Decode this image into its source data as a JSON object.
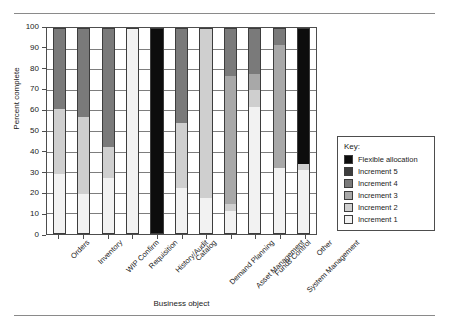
{
  "chart_data": {
    "type": "bar",
    "subtype": "stacked-bar-100",
    "title": "",
    "xlabel": "Business object",
    "ylabel": "Percent complete",
    "ylim": [
      0,
      100
    ],
    "ytick_values": [
      0,
      10,
      20,
      30,
      40,
      50,
      60,
      70,
      80,
      90,
      100
    ],
    "grid": true,
    "legend_position": "right",
    "legend_title": "Key:",
    "categories": [
      "Orders",
      "Inventory",
      "WIP Confirm",
      "Requisition",
      "History/Audit",
      "Catalog",
      "Demand Planning",
      "Asset Management",
      "Funds Control",
      "System Management",
      "Other"
    ],
    "series": [
      {
        "name": "Increment 1",
        "color": "#f2f2f2",
        "values": [
          29,
          19,
          27,
          100,
          0,
          22,
          17,
          11,
          62,
          32,
          31
        ]
      },
      {
        "name": "Increment 2",
        "color": "#cfcfcf",
        "values": [
          32,
          38,
          15,
          0,
          0,
          32,
          83,
          3,
          8,
          0,
          3
        ]
      },
      {
        "name": "Increment 3",
        "color": "#a8a8a8",
        "values": [
          0,
          0,
          0,
          0,
          0,
          0,
          0,
          63,
          8,
          60,
          0
        ]
      },
      {
        "name": "Increment 4",
        "color": "#7a7a7a",
        "values": [
          39,
          43,
          58,
          0,
          0,
          46,
          0,
          23,
          22,
          8,
          0
        ]
      },
      {
        "name": "Increment 5",
        "color": "#3d3d3d",
        "values": [
          0,
          0,
          0,
          0,
          0,
          0,
          0,
          0,
          0,
          0,
          0
        ]
      },
      {
        "name": "Flexible allocation",
        "color": "#0d0d0d",
        "values": [
          0,
          0,
          0,
          0,
          100,
          0,
          0,
          0,
          0,
          0,
          66
        ]
      }
    ],
    "legend_entries": [
      {
        "label": "Flexible allocation",
        "color": "#0d0d0d"
      },
      {
        "label": "Increment 5",
        "color": "#3d3d3d"
      },
      {
        "label": "Increment 4",
        "color": "#7a7a7a"
      },
      {
        "label": "Increment 3",
        "color": "#a8a8a8"
      },
      {
        "label": "Increment 2",
        "color": "#cfcfcf"
      },
      {
        "label": "Increment 1",
        "color": "#f2f2f2"
      }
    ]
  }
}
